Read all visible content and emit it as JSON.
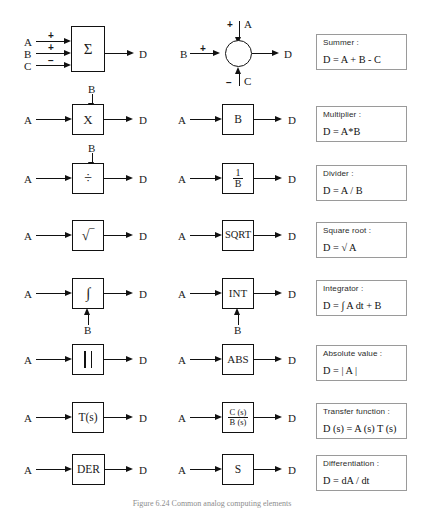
{
  "figure": {
    "caption": "Figure  6.24      Common analog computing elements"
  },
  "rows": [
    {
      "id": "summer",
      "left_block": {
        "glyph": "Σ",
        "type": "rect"
      },
      "left_inputs": [
        {
          "label": "A",
          "sign": "+"
        },
        {
          "label": "B",
          "sign": "+"
        },
        {
          "label": "C",
          "sign": "−"
        }
      ],
      "left_output": "D",
      "right_block": {
        "glyph": "",
        "type": "circle"
      },
      "right_inputs": [
        {
          "label": "A",
          "sign": "+",
          "side": "top"
        },
        {
          "label": "B",
          "sign": "+",
          "side": "left"
        },
        {
          "label": "C",
          "sign": "−",
          "side": "bottom"
        }
      ],
      "right_output": "D",
      "legend": {
        "name": "Summer :",
        "equation": "D = A + B - C"
      }
    },
    {
      "id": "multiplier",
      "left_block": {
        "glyph": "X",
        "type": "rect"
      },
      "left_input": "A",
      "left_top_input": "B",
      "left_output": "D",
      "right_block": {
        "glyph": "B",
        "type": "rect"
      },
      "right_input": "A",
      "right_output": "D",
      "legend": {
        "name": "Multiplier :",
        "equation": "D = A*B"
      }
    },
    {
      "id": "divider",
      "left_block": {
        "glyph": "÷",
        "type": "rect"
      },
      "left_input": "A",
      "left_top_input": "B",
      "left_output": "D",
      "right_block": {
        "numerator": "1",
        "denominator": "B",
        "type": "fraction"
      },
      "right_input": "A",
      "right_output": "D",
      "legend": {
        "name": "Divider :",
        "equation": "D = A / B"
      }
    },
    {
      "id": "square-root",
      "left_block": {
        "glyph": "√‾",
        "type": "rect"
      },
      "left_input": "A",
      "left_output": "D",
      "right_block": {
        "glyph": "SQRT",
        "type": "rect"
      },
      "right_input": "A",
      "right_output": "D",
      "legend": {
        "name": "Square root :",
        "equation": "D = √ A"
      }
    },
    {
      "id": "integrator",
      "left_block": {
        "glyph": "∫",
        "type": "rect"
      },
      "left_input": "A",
      "left_bottom_input": "B",
      "left_output": "D",
      "right_block": {
        "glyph": "INT",
        "type": "rect"
      },
      "right_input": "A",
      "right_bottom_input": "B",
      "right_output": "D",
      "legend": {
        "name": "Integrator :",
        "equation": "D = ∫ A dt  +  B"
      }
    },
    {
      "id": "absolute-value",
      "left_block": {
        "glyph": "| |",
        "type": "bars"
      },
      "left_input": "A",
      "left_output": "D",
      "right_block": {
        "glyph": "ABS",
        "type": "rect"
      },
      "right_input": "A",
      "right_output": "D",
      "legend": {
        "name": "Absolute value :",
        "equation": "D = | A |"
      }
    },
    {
      "id": "transfer-function",
      "left_block": {
        "glyph": "T(s)",
        "type": "rect"
      },
      "left_input": "A",
      "left_output": "D",
      "right_block": {
        "numerator": "C (s)",
        "denominator": "B (s)",
        "type": "fraction"
      },
      "right_input": "A",
      "right_output": "D",
      "legend": {
        "name": "Transfer  function :",
        "equation": "D (s) = A (s) T (s)"
      }
    },
    {
      "id": "differentiation",
      "left_block": {
        "glyph": "DER",
        "type": "rect"
      },
      "left_input": "A",
      "left_output": "D",
      "right_block": {
        "glyph": "S",
        "type": "rect"
      },
      "right_input": "A",
      "right_output": "D",
      "legend": {
        "name": "Differentiation :",
        "equation": "D = dA / dt"
      }
    }
  ]
}
